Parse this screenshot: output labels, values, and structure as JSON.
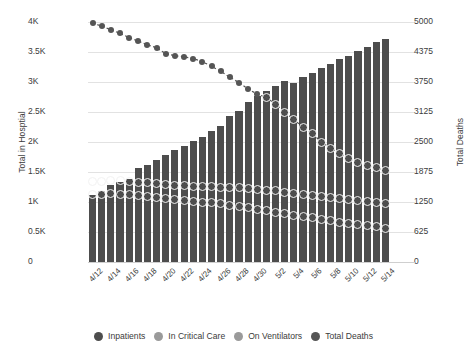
{
  "chart_data": {
    "type": "bar",
    "title": "",
    "subtitle": "",
    "xlabel": "",
    "ylabel": "Total in Hosptial",
    "ylabel_right": "Total Deaths",
    "grid": true,
    "legend_position": "bottom",
    "ylim": [
      0,
      4000
    ],
    "ylim_right": [
      0,
      5000
    ],
    "yticks": [
      0,
      500,
      1000,
      1500,
      2000,
      2500,
      3000,
      3500,
      4000
    ],
    "ytick_labels": [
      "0",
      "0.5K",
      "1K",
      "1.5K",
      "2K",
      "2.5K",
      "3K",
      "3.5K",
      "4K"
    ],
    "yticks_right": [
      0,
      625,
      1250,
      1875,
      2500,
      3125,
      3750,
      4375,
      5000
    ],
    "ytick_labels_right": [
      "0",
      "625",
      "1250",
      "1875",
      "2500",
      "3125",
      "3750",
      "4375",
      "5000"
    ],
    "categories": [
      "4/12",
      "4/13",
      "4/14",
      "4/15",
      "4/16",
      "4/17",
      "4/18",
      "4/19",
      "4/20",
      "4/21",
      "4/22",
      "4/23",
      "4/24",
      "4/25",
      "4/26",
      "4/27",
      "4/28",
      "4/29",
      "4/30",
      "5/1",
      "5/2",
      "5/3",
      "5/4",
      "5/5",
      "5/6",
      "5/7",
      "5/8",
      "5/9",
      "5/10",
      "5/11",
      "5/12",
      "5/13",
      "5/14"
    ],
    "xtick_labels_shown": [
      "4/12",
      "",
      "4/14",
      "",
      "4/16",
      "",
      "4/18",
      "",
      "4/20",
      "",
      "4/22",
      "",
      "4/24",
      "",
      "4/26",
      "",
      "4/28",
      "",
      "4/30",
      "",
      "5/2",
      "",
      "5/4",
      "",
      "5/6",
      "",
      "5/8",
      "",
      "5/10",
      "",
      "5/12",
      "",
      "5/14"
    ],
    "series": [
      {
        "name": "Inpatients",
        "axis": "left",
        "type": "bar",
        "color": "#4d4d4d",
        "values": [
          1120,
          1190,
          1280,
          1330,
          1390,
          1560,
          1620,
          1700,
          1780,
          1860,
          1930,
          2010,
          2090,
          2180,
          2260,
          2430,
          2520,
          2670,
          2760,
          2850,
          2940,
          3010,
          2990,
          3080,
          3150,
          3230,
          3300,
          3380,
          3430,
          3510,
          3580,
          3660,
          3720
        ]
      },
      {
        "name": "In Critical Care",
        "axis": "left",
        "type": "marker",
        "color": "#f2f2f2",
        "values": [
          1340,
          1350,
          1355,
          1360,
          1340,
          1330,
          1320,
          1310,
          1290,
          1280,
          1270,
          1265,
          1260,
          1255,
          1250,
          1245,
          1240,
          1230,
          1215,
          1200,
          1185,
          1165,
          1150,
          1130,
          1110,
          1090,
          1075,
          1055,
          1040,
          1025,
          1010,
          995,
          980
        ]
      },
      {
        "name": "On Ventilators",
        "axis": "left",
        "type": "marker",
        "color": "#f2f2f2",
        "values": [
          1120,
          1130,
          1135,
          1130,
          1120,
          1105,
          1090,
          1075,
          1060,
          1045,
          1030,
          1015,
          1000,
          985,
          970,
          950,
          930,
          905,
          880,
          855,
          830,
          805,
          780,
          760,
          735,
          710,
          690,
          665,
          645,
          625,
          605,
          585,
          565
        ]
      },
      {
        "name": "Total Deaths",
        "axis": "right",
        "type": "line",
        "color": "#555555",
        "values_left_scale": [
          3985,
          3930,
          3870,
          3810,
          3740,
          3680,
          3620,
          3570,
          3470,
          3440,
          3420,
          3390,
          3340,
          3260,
          3180,
          3080,
          2990,
          2880,
          2800,
          2740,
          2630,
          2500,
          2370,
          2250,
          2140,
          2000,
          1900,
          1810,
          1720,
          1660,
          1610,
          1570,
          1530
        ],
        "values": [
          4981,
          4913,
          4838,
          4763,
          4675,
          4600,
          4525,
          4463,
          4338,
          4300,
          4275,
          4238,
          4175,
          4075,
          3975,
          3850,
          3738,
          3600,
          3500,
          3425,
          3288,
          3125,
          2963,
          2813,
          2675,
          2500,
          2375,
          2263,
          2150,
          2075,
          2013,
          1963,
          1913
        ]
      }
    ]
  },
  "legend": {
    "items": [
      {
        "label": "Inpatients",
        "color": "#4d4d4d"
      },
      {
        "label": "In Critical Care",
        "color": "#9a9a9a"
      },
      {
        "label": "On Ventilators",
        "color": "#9a9a9a"
      },
      {
        "label": "Total Deaths",
        "color": "#555555"
      }
    ]
  },
  "colors": {
    "bar": "#4d4d4d",
    "marker_outline": "#f2f2f2",
    "line": "#555555",
    "grid": "#e2e2e2",
    "text": "#3b3b3b",
    "background": "#ffffff"
  }
}
